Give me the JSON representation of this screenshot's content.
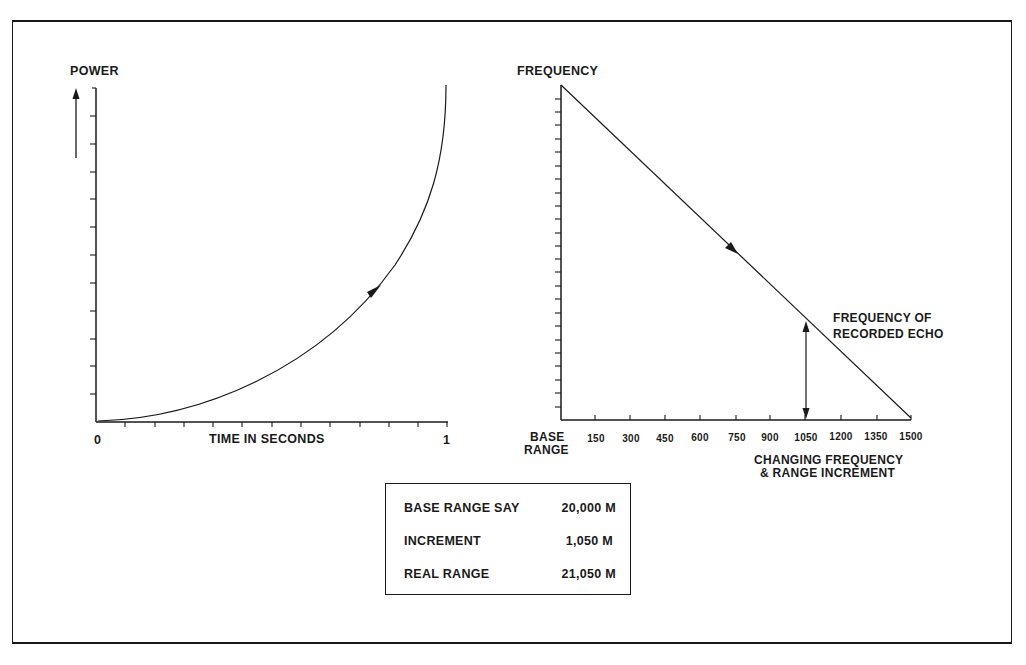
{
  "left_chart": {
    "y_label": "POWER",
    "x_label": "TIME IN SECONDS",
    "x_tick_start": "0",
    "x_tick_end": "1"
  },
  "right_chart": {
    "y_label": "FREQUENCY",
    "x_base_label_line1": "BASE",
    "x_base_label_line2": "RANGE",
    "x_ticks": [
      "150",
      "300",
      "450",
      "600",
      "750",
      "900",
      "1050",
      "1200",
      "1350",
      "1500"
    ],
    "x_title_line1": "CHANGING FREQUENCY",
    "x_title_line2": "& RANGE INCREMENT",
    "annotation_line1": "FREQUENCY OF",
    "annotation_line2": "RECORDED ECHO"
  },
  "info_box": {
    "rows": [
      {
        "label": "BASE RANGE SAY",
        "value": "20,000 M"
      },
      {
        "label": "INCREMENT",
        "value": "1,050 M"
      },
      {
        "label": "REAL RANGE",
        "value": "21,050 M"
      }
    ]
  }
}
